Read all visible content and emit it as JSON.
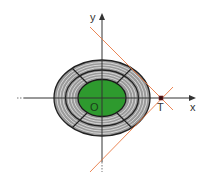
{
  "diagram": {
    "labels": {
      "y_axis": "y",
      "x_axis": "x",
      "origin": "O",
      "point_t": "T"
    },
    "colors": {
      "background": "#ffffff",
      "outer_ring": "#9a9a9a",
      "ring_lines": "#e6e6e6",
      "outline": "#222222",
      "inner_fill": "#2e9a2e",
      "tangent_line": "#e8733a",
      "axis": "#333333"
    },
    "elements": [
      "x-axis with arrow",
      "y-axis with arrow",
      "outer striped ellipse ring",
      "middle ellipse boundary",
      "green inner ellipse",
      "radial dividers at 45 degrees",
      "two tangent lines meeting at point T on x-axis"
    ]
  }
}
